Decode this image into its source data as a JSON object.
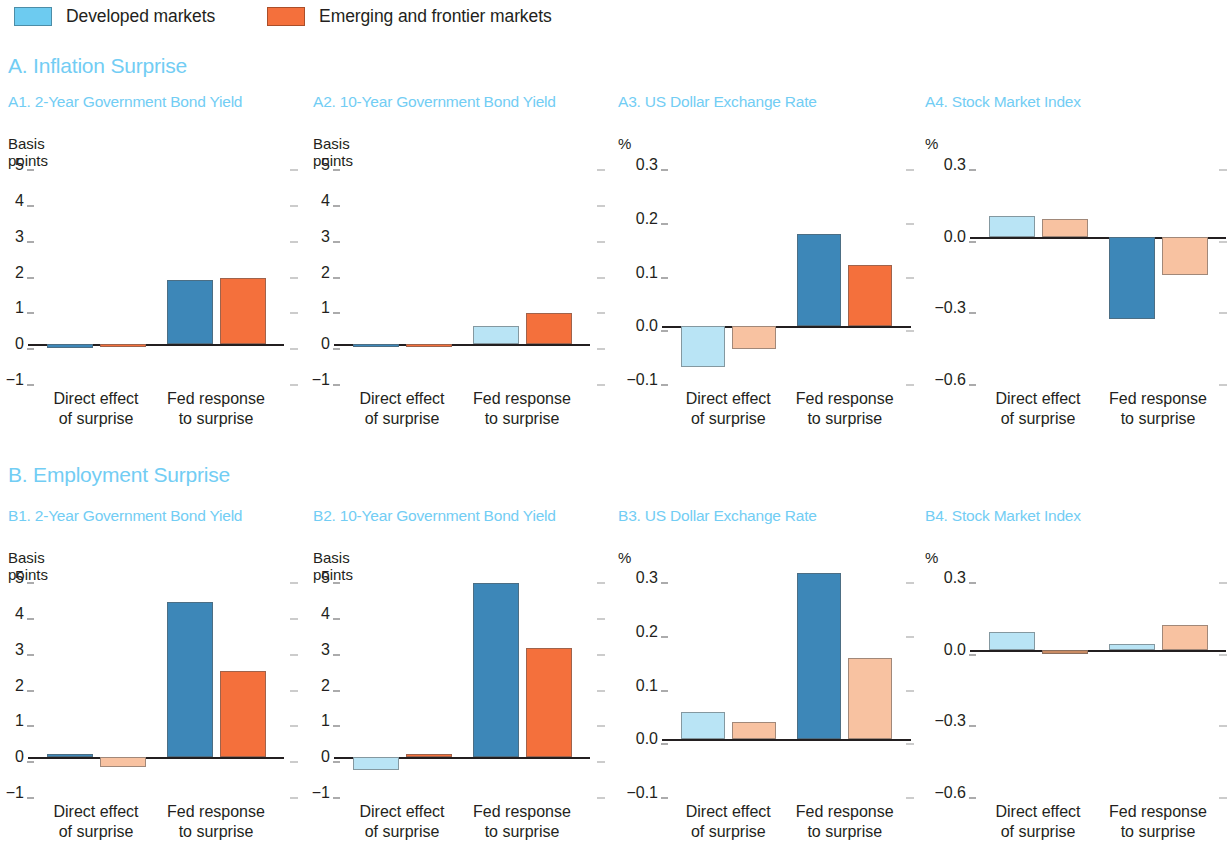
{
  "legend": {
    "items": [
      {
        "label": "Developed markets",
        "color": "#6dcbf0",
        "name": "developed-markets"
      },
      {
        "label": "Emerging and frontier markets",
        "color": "#f4703c",
        "name": "emerging-frontier-markets"
      }
    ]
  },
  "sections": [
    {
      "id": "A",
      "title": "A. Inflation Surprise"
    },
    {
      "id": "B",
      "title": "B. Employment Surprise"
    }
  ],
  "group_labels": [
    {
      "line1": "Direct effect",
      "line2": "of surprise"
    },
    {
      "line1": "Fed response",
      "line2": "to surprise"
    }
  ],
  "colors": {
    "title_blue": "#72cdf4",
    "dark_blue": "#3d87b8",
    "light_blue": "#b9e4f5",
    "orange": "#f4703c",
    "light_orange": "#f8c2a1",
    "axis": "#231f20"
  },
  "chart_data": [
    {
      "id": "A1",
      "type": "bar",
      "title": "A1. 2-Year Government Bond Yield",
      "ylabel": "Basis points",
      "unit": "Basis points",
      "categories": [
        "Direct effect of surprise",
        "Fed response to surprise"
      ],
      "series": [
        {
          "name": "Developed markets",
          "values": [
            -0.1,
            1.78
          ]
        },
        {
          "name": "Emerging and frontier markets",
          "values": [
            -0.03,
            1.85
          ]
        }
      ],
      "ylim": [
        -1,
        5
      ],
      "yticks": [
        5,
        4,
        3,
        2,
        1,
        0,
        -1
      ],
      "ytick_labels": [
        "5",
        "4",
        "3",
        "2",
        "1",
        "0",
        "−1"
      ],
      "grid": false,
      "legend_position": "top"
    },
    {
      "id": "A2",
      "type": "bar",
      "title": "A2. 10-Year Government Bond Yield",
      "ylabel": "Basis points",
      "unit": "Basis points",
      "categories": [
        "Direct effect of surprise",
        "Fed response to surprise"
      ],
      "series": [
        {
          "name": "Developed markets",
          "values": [
            -0.02,
            0.52
          ]
        },
        {
          "name": "Emerging and frontier markets",
          "values": [
            -0.02,
            0.88
          ]
        }
      ],
      "ylim": [
        -1,
        5
      ],
      "yticks": [
        5,
        4,
        3,
        2,
        1,
        0,
        -1
      ],
      "ytick_labels": [
        "5",
        "4",
        "3",
        "2",
        "1",
        "0",
        "−1"
      ],
      "grid": false,
      "legend_position": "top"
    },
    {
      "id": "A3",
      "type": "bar",
      "title": "A3. US Dollar Exchange Rate",
      "ylabel": "%",
      "unit": "%",
      "categories": [
        "Direct effect of surprise",
        "Fed response to surprise"
      ],
      "series": [
        {
          "name": "Developed markets",
          "values": [
            -0.075,
            0.172
          ]
        },
        {
          "name": "Emerging and frontier markets",
          "values": [
            -0.042,
            0.114
          ]
        }
      ],
      "ylim": [
        -0.1,
        0.3
      ],
      "yticks": [
        0.3,
        0.2,
        0.1,
        0.0,
        -0.1
      ],
      "ytick_labels": [
        "0.3",
        "0.2",
        "0.1",
        "0.0",
        "−0.1"
      ],
      "grid": false,
      "legend_position": "top"
    },
    {
      "id": "A4",
      "type": "bar",
      "title": "A4. Stock Market Index",
      "ylabel": "%",
      "unit": "%",
      "categories": [
        "Direct effect of surprise",
        "Fed response to surprise"
      ],
      "series": [
        {
          "name": "Developed markets",
          "values": [
            0.085,
            -0.345
          ]
        },
        {
          "name": "Emerging and frontier markets",
          "values": [
            0.075,
            -0.16
          ]
        }
      ],
      "ylim": [
        -0.6,
        0.3
      ],
      "yticks": [
        0.3,
        0.0,
        -0.3,
        -0.6
      ],
      "ytick_labels": [
        "0.3",
        "0.0",
        "−0.3",
        "−0.6"
      ],
      "grid": false,
      "legend_position": "top"
    },
    {
      "id": "B1",
      "type": "bar",
      "title": "B1. 2-Year Government Bond Yield",
      "ylabel": "Basis points",
      "unit": "Basis points",
      "categories": [
        "Direct effect of surprise",
        "Fed response to surprise"
      ],
      "series": [
        {
          "name": "Developed markets",
          "values": [
            0.04,
            4.32
          ]
        },
        {
          "name": "Emerging and frontier markets",
          "values": [
            -0.27,
            2.4
          ]
        }
      ],
      "ylim": [
        -1,
        5
      ],
      "yticks": [
        5,
        4,
        3,
        2,
        1,
        0,
        -1
      ],
      "ytick_labels": [
        "5",
        "4",
        "3",
        "2",
        "1",
        "0",
        "−1"
      ],
      "grid": false,
      "legend_position": "top"
    },
    {
      "id": "B2",
      "type": "bar",
      "title": "B2. 10-Year Government Bond Yield",
      "ylabel": "Basis points",
      "unit": "Basis points",
      "categories": [
        "Direct effect of surprise",
        "Fed response to surprise"
      ],
      "series": [
        {
          "name": "Developed markets",
          "values": [
            -0.36,
            4.85
          ]
        },
        {
          "name": "Emerging and frontier markets",
          "values": [
            0.04,
            3.05
          ]
        }
      ],
      "ylim": [
        -1,
        5
      ],
      "yticks": [
        5,
        4,
        3,
        2,
        1,
        0,
        -1
      ],
      "ytick_labels": [
        "5",
        "4",
        "3",
        "2",
        "1",
        "0",
        "−1"
      ],
      "grid": false,
      "legend_position": "top"
    },
    {
      "id": "B3",
      "type": "bar",
      "title": "B3. US Dollar Exchange Rate",
      "ylabel": "%",
      "unit": "%",
      "categories": [
        "Direct effect of surprise",
        "Fed response to surprise"
      ],
      "series": [
        {
          "name": "Developed markets",
          "values": [
            0.05,
            0.31
          ]
        },
        {
          "name": "Emerging and frontier markets",
          "values": [
            0.032,
            0.152
          ]
        }
      ],
      "ylim": [
        -0.1,
        0.3
      ],
      "yticks": [
        0.3,
        0.2,
        0.1,
        0.0,
        -0.1
      ],
      "ytick_labels": [
        "0.3",
        "0.2",
        "0.1",
        "0.0",
        "−0.1"
      ],
      "grid": false,
      "legend_position": "top"
    },
    {
      "id": "B4",
      "type": "bar",
      "title": "B4. Stock Market Index",
      "ylabel": "%",
      "unit": "%",
      "categories": [
        "Direct effect of surprise",
        "Fed response to surprise"
      ],
      "series": [
        {
          "name": "Developed markets",
          "values": [
            0.072,
            0.022
          ]
        },
        {
          "name": "Emerging and frontier markets",
          "values": [
            -0.018,
            0.103
          ]
        }
      ],
      "ylim": [
        -0.6,
        0.3
      ],
      "yticks": [
        0.3,
        0.0,
        -0.3,
        -0.6
      ],
      "ytick_labels": [
        "0.3",
        "0.0",
        "−0.3",
        "−0.6"
      ],
      "grid": false,
      "legend_position": "top"
    }
  ]
}
